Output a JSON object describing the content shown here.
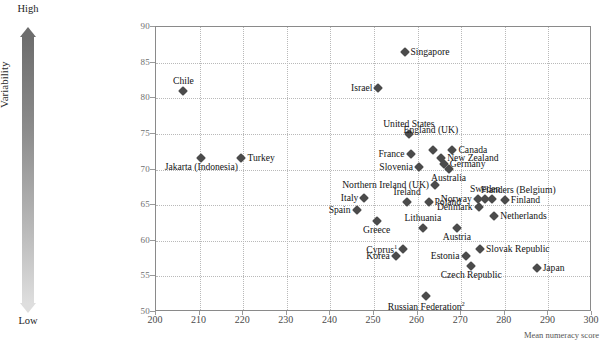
{
  "chart_data": {
    "type": "scatter",
    "title": "",
    "xlabel": "Mean numeracy score",
    "ylabel": "Variability",
    "xlim": [
      200,
      300
    ],
    "ylim": [
      50,
      90
    ],
    "xticks": [
      200,
      210,
      220,
      230,
      240,
      250,
      260,
      270,
      280,
      290,
      300
    ],
    "yticks": [
      50,
      55,
      60,
      65,
      70,
      75,
      80,
      85,
      90
    ],
    "grid": true,
    "legend": "none",
    "axis_annotations": {
      "y_high": "High",
      "y_low": "Low"
    },
    "points": [
      {
        "name": "Singapore",
        "x": 257.0,
        "y": 86.5,
        "pos": "right"
      },
      {
        "name": "Chile",
        "x": 206.3,
        "y": 81.0,
        "pos": "above"
      },
      {
        "name": "Israel",
        "x": 251.0,
        "y": 81.5,
        "pos": "left"
      },
      {
        "name": "United States",
        "x": 258.0,
        "y": 75.0,
        "pos": "above"
      },
      {
        "name": "England (UK)",
        "x": 263.5,
        "y": 72.8,
        "pos": "above2"
      },
      {
        "name": "Canada",
        "x": 268.0,
        "y": 72.7,
        "pos": "right"
      },
      {
        "name": "France",
        "x": 258.4,
        "y": 72.2,
        "pos": "left"
      },
      {
        "name": "New Zealand",
        "x": 265.4,
        "y": 71.6,
        "pos": "right"
      },
      {
        "name": "Germany",
        "x": 266.0,
        "y": 70.8,
        "pos": "right"
      },
      {
        "name": "Turkey",
        "x": 219.6,
        "y": 71.6,
        "pos": "right"
      },
      {
        "name": "Jakarta (Indonesia)",
        "x": 210.4,
        "y": 71.6,
        "pos": "below"
      },
      {
        "name": "Slovenia",
        "x": 260.3,
        "y": 70.3,
        "pos": "left"
      },
      {
        "name": "Australia",
        "x": 267.1,
        "y": 70.1,
        "pos": "below"
      },
      {
        "name": "Northern Ireland (UK)",
        "x": 264.0,
        "y": 67.8,
        "pos": "left"
      },
      {
        "name": "Sweden",
        "x": 275.5,
        "y": 65.8,
        "pos": "above"
      },
      {
        "name": "Flanders (Belgium)",
        "x": 277.1,
        "y": 65.8,
        "pos": "above3"
      },
      {
        "name": "Norway",
        "x": 273.8,
        "y": 65.8,
        "pos": "left"
      },
      {
        "name": "Finland",
        "x": 280.0,
        "y": 65.7,
        "pos": "right"
      },
      {
        "name": "Italy",
        "x": 247.8,
        "y": 66.0,
        "pos": "left"
      },
      {
        "name": "Ireland",
        "x": 257.6,
        "y": 65.4,
        "pos": "above"
      },
      {
        "name": "Poland",
        "x": 262.5,
        "y": 65.4,
        "pos": "right"
      },
      {
        "name": "Denmark",
        "x": 274.0,
        "y": 64.8,
        "pos": "left"
      },
      {
        "name": "Spain",
        "x": 246.0,
        "y": 64.3,
        "pos": "left"
      },
      {
        "name": "Netherlands",
        "x": 277.6,
        "y": 63.5,
        "pos": "right"
      },
      {
        "name": "Greece",
        "x": 250.6,
        "y": 62.8,
        "pos": "below"
      },
      {
        "name": "Lithuania",
        "x": 261.2,
        "y": 61.8,
        "pos": "above"
      },
      {
        "name": "Austria",
        "x": 269.0,
        "y": 61.8,
        "pos": "below"
      },
      {
        "name": "Cyprus1",
        "x": 256.7,
        "y": 58.8,
        "pos": "left",
        "display": "Cyprus",
        "sup": "1"
      },
      {
        "name": "Slovak Republic",
        "x": 274.3,
        "y": 58.8,
        "pos": "right"
      },
      {
        "name": "Korea",
        "x": 255.0,
        "y": 57.8,
        "pos": "left"
      },
      {
        "name": "Estonia",
        "x": 271.0,
        "y": 57.8,
        "pos": "left"
      },
      {
        "name": "Japan",
        "x": 287.3,
        "y": 56.2,
        "pos": "right"
      },
      {
        "name": "Czech Republic",
        "x": 272.3,
        "y": 56.4,
        "pos": "below"
      },
      {
        "name": "Russian Federation2",
        "x": 262.0,
        "y": 52.3,
        "pos": "below",
        "display": "Russian Federation",
        "sup": "2"
      }
    ]
  }
}
